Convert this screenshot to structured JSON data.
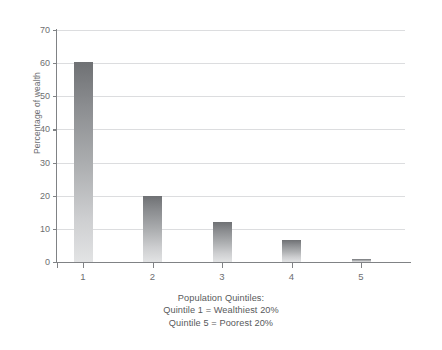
{
  "figure": {
    "title_cropped": "",
    "ylabel": "Percentage of wealth",
    "xlabel": "",
    "caption": {
      "line1": "Population Quintiles:",
      "line2": "Quintile 1 = Wealthiest 20%",
      "line3": "Quintile 5 = Poorest 20%"
    }
  },
  "colors": {
    "bar_top": "#6f7174",
    "bar_bottom": "#e2e3e4",
    "axis": "#808285",
    "grid": "#dcdddf",
    "text": "#58595b"
  },
  "chart_data": {
    "type": "bar",
    "title": "",
    "xlabel": "",
    "ylabel": "Percentage of wealth",
    "categories": [
      "1",
      "2",
      "3",
      "4",
      "5"
    ],
    "values": [
      60.5,
      20.0,
      12.0,
      6.5,
      1.0
    ],
    "ylim": [
      0,
      70
    ],
    "yticks": [
      0,
      10,
      20,
      30,
      40,
      50,
      60,
      70
    ],
    "ytick_labels": [
      "0",
      "10",
      "20",
      "30",
      "40",
      "50",
      "60",
      "70"
    ],
    "xtick_labels": [
      "1",
      "2",
      "3",
      "4",
      "5"
    ],
    "grid": "horizontal",
    "legend": "none",
    "annotations": [
      "Population Quintiles:",
      "Quintile 1 = Wealthiest 20%",
      "Quintile 5 = Poorest 20%"
    ]
  }
}
